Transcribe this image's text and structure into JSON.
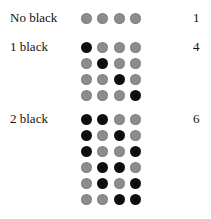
{
  "groups": [
    {
      "label": "No black",
      "count": "1",
      "rows": [
        [
          "gray",
          "gray",
          "gray",
          "gray"
        ]
      ]
    },
    {
      "label": "1 black",
      "count": "4",
      "rows": [
        [
          "black",
          "gray",
          "gray",
          "gray"
        ],
        [
          "gray",
          "black",
          "gray",
          "gray"
        ],
        [
          "gray",
          "gray",
          "black",
          "gray"
        ],
        [
          "gray",
          "gray",
          "gray",
          "black"
        ]
      ]
    },
    {
      "label": "2 black",
      "count": "6",
      "rows": [
        [
          "black",
          "black",
          "gray",
          "gray"
        ],
        [
          "black",
          "gray",
          "black",
          "gray"
        ],
        [
          "black",
          "gray",
          "gray",
          "black"
        ],
        [
          "gray",
          "black",
          "black",
          "gray"
        ],
        [
          "gray",
          "black",
          "gray",
          "black"
        ],
        [
          "gray",
          "gray",
          "black",
          "black"
        ]
      ]
    }
  ],
  "colors": {
    "gray": "#8c8c8c",
    "black": "#0d0d0d"
  }
}
